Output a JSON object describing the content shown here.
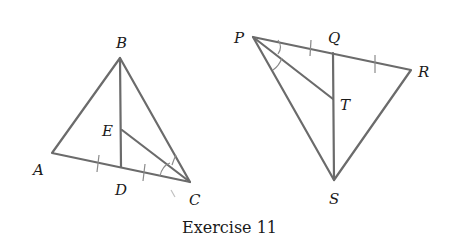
{
  "caption": "Exercise 11",
  "figures": [
    {
      "name": "triangle-ABC",
      "vertices": {
        "A": {
          "label": "A",
          "x": 52,
          "y": 153
        },
        "B": {
          "label": "B",
          "x": 120,
          "y": 58
        },
        "C": {
          "label": "C",
          "x": 190,
          "y": 182
        },
        "D": {
          "label": "D",
          "x": 121,
          "y": 167
        },
        "E": {
          "label": "E",
          "x": 122,
          "y": 130
        }
      },
      "segments": [
        "AB",
        "BC",
        "AC",
        "BD",
        "EC"
      ],
      "markings": {
        "equal_segments": [
          "AD",
          "DC"
        ],
        "equal_angles": [
          "ACE",
          "ECB"
        ]
      }
    },
    {
      "name": "triangle-PRS",
      "vertices": {
        "P": {
          "label": "P",
          "x": 253,
          "y": 37
        },
        "Q": {
          "label": "Q",
          "x": 333,
          "y": 53
        },
        "R": {
          "label": "R",
          "x": 411,
          "y": 70
        },
        "S": {
          "label": "S",
          "x": 334,
          "y": 180
        },
        "T": {
          "label": "T",
          "x": 333,
          "y": 99
        }
      },
      "segments": [
        "PR",
        "PS",
        "RS",
        "QS",
        "PT"
      ],
      "markings": {
        "equal_segments": [
          "PQ",
          "QR"
        ],
        "equal_angles": [
          "QPT",
          "TPS"
        ]
      }
    }
  ],
  "labels": {
    "A": "A",
    "B": "B",
    "C": "C",
    "D": "D",
    "E": "E",
    "P": "P",
    "Q": "Q",
    "R": "R",
    "S": "S",
    "T": "T"
  },
  "colors": {
    "line": "#6b6b6b",
    "text": "#1a1a1a",
    "background": "#ffffff"
  }
}
